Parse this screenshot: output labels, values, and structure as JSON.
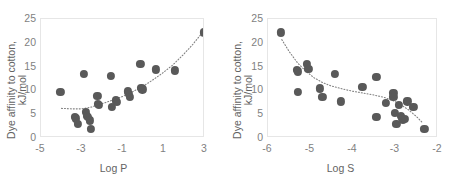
{
  "figure": {
    "marker_color": "#595959",
    "trend_color": "#808080",
    "axis_color": "#d9d9d9",
    "text_color": "#7f7f7f"
  },
  "chart_data": [
    {
      "type": "scatter",
      "title": "",
      "xlabel": "Log P",
      "ylabel": "Dye affinity to cotton,\nkJ/mol",
      "xlim": [
        -5.0,
        3.0
      ],
      "ylim": [
        0,
        25
      ],
      "xticks": [
        -5,
        -3,
        -1,
        1,
        3
      ],
      "xticklabels": [
        "-5",
        "-3",
        "-1",
        "1",
        "3"
      ],
      "yticks": [
        0,
        5,
        10,
        15,
        20,
        25
      ],
      "yticklabels": [
        "0",
        "5",
        "10",
        "15",
        "20",
        "25"
      ],
      "grid": false,
      "legend": "none",
      "points": [
        {
          "x": -4.05,
          "y": 9.6
        },
        {
          "x": -3.35,
          "y": 4.5
        },
        {
          "x": -3.3,
          "y": 4.1
        },
        {
          "x": -3.2,
          "y": 3.0
        },
        {
          "x": -2.9,
          "y": 13.4
        },
        {
          "x": -2.8,
          "y": 5.4
        },
        {
          "x": -2.78,
          "y": 4.7
        },
        {
          "x": -2.72,
          "y": 4.4
        },
        {
          "x": -2.6,
          "y": 3.7
        },
        {
          "x": -2.55,
          "y": 1.9
        },
        {
          "x": -2.25,
          "y": 8.8
        },
        {
          "x": -2.22,
          "y": 7.2
        },
        {
          "x": -2.18,
          "y": 6.9
        },
        {
          "x": -1.6,
          "y": 13.1
        },
        {
          "x": -1.55,
          "y": 6.6
        },
        {
          "x": -1.35,
          "y": 7.9
        },
        {
          "x": -1.3,
          "y": 7.6
        },
        {
          "x": -0.75,
          "y": 9.8
        },
        {
          "x": -0.7,
          "y": 9.2
        },
        {
          "x": -0.65,
          "y": 8.7
        },
        {
          "x": -0.15,
          "y": 15.6
        },
        {
          "x": -0.1,
          "y": 10.6
        },
        {
          "x": -0.05,
          "y": 10.2
        },
        {
          "x": 0.6,
          "y": 14.4
        },
        {
          "x": 1.55,
          "y": 14.2
        },
        {
          "x": 2.95,
          "y": 22.2
        }
      ],
      "trendline": {
        "style": "dotted",
        "points": [
          {
            "x": -4.0,
            "y": 5.9
          },
          {
            "x": -3.5,
            "y": 5.8
          },
          {
            "x": -3.0,
            "y": 5.8
          },
          {
            "x": -2.5,
            "y": 6.2
          },
          {
            "x": -2.0,
            "y": 6.9
          },
          {
            "x": -1.5,
            "y": 7.6
          },
          {
            "x": -1.0,
            "y": 8.4
          },
          {
            "x": -0.5,
            "y": 9.4
          },
          {
            "x": 0.0,
            "y": 10.5
          },
          {
            "x": 0.5,
            "y": 11.9
          },
          {
            "x": 1.0,
            "y": 13.4
          },
          {
            "x": 1.5,
            "y": 15.1
          },
          {
            "x": 2.0,
            "y": 17.2
          },
          {
            "x": 2.5,
            "y": 19.5
          },
          {
            "x": 2.95,
            "y": 21.9
          }
        ]
      }
    },
    {
      "type": "scatter",
      "title": "",
      "xlabel": "Log S",
      "ylabel": "Dye affinity to cotton,\nkJ/mol",
      "xlim": [
        -6.0,
        -2.0
      ],
      "ylim": [
        0,
        25
      ],
      "xticks": [
        -6,
        -5,
        -4,
        -3,
        -2
      ],
      "xticklabels": [
        "-6",
        "-5",
        "-4",
        "-3",
        "-2"
      ],
      "yticks": [
        0,
        5,
        10,
        15,
        20,
        25
      ],
      "yticklabels": [
        "0",
        "5",
        "10",
        "15",
        "20",
        "25"
      ],
      "grid": false,
      "legend": "none",
      "points": [
        {
          "x": -5.7,
          "y": 22.2
        },
        {
          "x": -5.32,
          "y": 14.3
        },
        {
          "x": -5.3,
          "y": 14.0
        },
        {
          "x": -5.3,
          "y": 9.6
        },
        {
          "x": -5.08,
          "y": 15.5
        },
        {
          "x": -5.05,
          "y": 14.6
        },
        {
          "x": -4.78,
          "y": 10.4
        },
        {
          "x": -4.72,
          "y": 8.7
        },
        {
          "x": -4.42,
          "y": 13.4
        },
        {
          "x": -4.28,
          "y": 7.7
        },
        {
          "x": -3.78,
          "y": 10.8
        },
        {
          "x": -3.45,
          "y": 12.9
        },
        {
          "x": -3.45,
          "y": 4.5
        },
        {
          "x": -3.22,
          "y": 7.3
        },
        {
          "x": -3.05,
          "y": 9.4
        },
        {
          "x": -3.05,
          "y": 8.7
        },
        {
          "x": -3.02,
          "y": 5.3
        },
        {
          "x": -2.98,
          "y": 3.0
        },
        {
          "x": -2.92,
          "y": 6.9
        },
        {
          "x": -2.88,
          "y": 4.6
        },
        {
          "x": -2.85,
          "y": 4.3
        },
        {
          "x": -2.82,
          "y": 3.8
        },
        {
          "x": -2.78,
          "y": 4.0
        },
        {
          "x": -2.72,
          "y": 7.7
        },
        {
          "x": -2.58,
          "y": 6.6
        },
        {
          "x": -2.32,
          "y": 1.9
        }
      ],
      "trendline": {
        "style": "dotted",
        "points": [
          {
            "x": -5.68,
            "y": 20.6
          },
          {
            "x": -5.5,
            "y": 18.0
          },
          {
            "x": -5.3,
            "y": 15.6
          },
          {
            "x": -5.1,
            "y": 13.8
          },
          {
            "x": -4.9,
            "y": 12.4
          },
          {
            "x": -4.7,
            "y": 11.4
          },
          {
            "x": -4.5,
            "y": 10.7
          },
          {
            "x": -4.25,
            "y": 10.1
          },
          {
            "x": -4.0,
            "y": 9.6
          },
          {
            "x": -3.75,
            "y": 9.2
          },
          {
            "x": -3.5,
            "y": 8.8
          },
          {
            "x": -3.25,
            "y": 8.3
          },
          {
            "x": -3.05,
            "y": 7.7
          },
          {
            "x": -2.85,
            "y": 6.8
          },
          {
            "x": -2.65,
            "y": 5.6
          },
          {
            "x": -2.45,
            "y": 4.1
          },
          {
            "x": -2.32,
            "y": 2.9
          }
        ]
      }
    }
  ]
}
